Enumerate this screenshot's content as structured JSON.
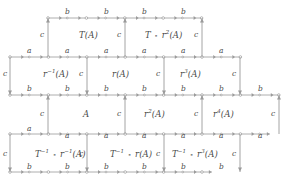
{
  "figure": {
    "name": "tiling-diagram",
    "stroke_color": "#9a9a9a",
    "text_color": "#4a4a4a",
    "background": "#ffffff"
  },
  "cells": [
    {
      "id": "cell-TA",
      "text": "T(A)",
      "x": 79,
      "y": 31
    },
    {
      "id": "cell-Tr2A",
      "text": "T ∘ r²(A)",
      "x": 145,
      "y": 31
    },
    {
      "id": "cell-rinvA",
      "text": "r⁻¹(A)",
      "x": 43,
      "y": 70
    },
    {
      "id": "cell-rA",
      "text": "r(A)",
      "x": 112,
      "y": 70
    },
    {
      "id": "cell-r3A",
      "text": "r³(A)",
      "x": 180,
      "y": 70
    },
    {
      "id": "cell-A",
      "text": "A",
      "x": 83,
      "y": 110
    },
    {
      "id": "cell-r2A",
      "text": "r²(A)",
      "x": 144,
      "y": 110
    },
    {
      "id": "cell-r4A",
      "text": "r⁴(A)",
      "x": 213,
      "y": 110
    },
    {
      "id": "cell-Tinv-rinvA",
      "text": "T⁻¹ ∘ r⁻¹(A)",
      "x": 35,
      "y": 150
    },
    {
      "id": "cell-Tinv-rA",
      "text": "T⁻¹ ∘ r(A)",
      "x": 110,
      "y": 150
    },
    {
      "id": "cell-Tinv-r3A",
      "text": "T⁻¹ ∘ r³(A)",
      "x": 172,
      "y": 150
    }
  ],
  "edge_labels": {
    "row1_b": [
      {
        "text": "b",
        "x": 65,
        "y": 8
      },
      {
        "text": "b",
        "x": 104,
        "y": 8
      },
      {
        "text": "b",
        "x": 142,
        "y": 8
      },
      {
        "text": "b",
        "x": 181,
        "y": 8
      }
    ],
    "row2_a": [
      {
        "text": "a",
        "x": 27,
        "y": 47
      },
      {
        "text": "a",
        "x": 65,
        "y": 47
      },
      {
        "text": "a",
        "x": 104,
        "y": 47
      },
      {
        "text": "a",
        "x": 142,
        "y": 47
      },
      {
        "text": "a",
        "x": 181,
        "y": 47
      },
      {
        "text": "a",
        "x": 219,
        "y": 47
      }
    ],
    "row3_b": [
      {
        "text": "b",
        "x": 27,
        "y": 85
      },
      {
        "text": "b",
        "x": 65,
        "y": 85
      },
      {
        "text": "b",
        "x": 104,
        "y": 85
      },
      {
        "text": "b",
        "x": 142,
        "y": 85
      },
      {
        "text": "b",
        "x": 181,
        "y": 85
      },
      {
        "text": "b",
        "x": 219,
        "y": 85
      },
      {
        "text": "b",
        "x": 258,
        "y": 85
      }
    ],
    "row4_a": [
      {
        "text": "a",
        "x": 27,
        "y": 125
      },
      {
        "text": "a",
        "x": 65,
        "y": 132
      },
      {
        "text": "a",
        "x": 104,
        "y": 132
      },
      {
        "text": "a",
        "x": 142,
        "y": 132
      },
      {
        "text": "a",
        "x": 181,
        "y": 132
      },
      {
        "text": "a",
        "x": 219,
        "y": 132
      },
      {
        "text": "a",
        "x": 258,
        "y": 132
      }
    ],
    "row5_b": [
      {
        "text": "b",
        "x": 27,
        "y": 163
      },
      {
        "text": "b",
        "x": 65,
        "y": 163
      },
      {
        "text": "b",
        "x": 104,
        "y": 163
      },
      {
        "text": "b",
        "x": 142,
        "y": 163
      },
      {
        "text": "b",
        "x": 181,
        "y": 163
      },
      {
        "text": "b",
        "x": 219,
        "y": 163
      }
    ],
    "vertical_c": [
      {
        "text": "c",
        "x": 40,
        "y": 31
      },
      {
        "text": "c",
        "x": 117,
        "y": 31
      },
      {
        "text": "c",
        "x": 194,
        "y": 31
      },
      {
        "text": "c",
        "x": 3,
        "y": 70
      },
      {
        "text": "c",
        "x": 79,
        "y": 70
      },
      {
        "text": "c",
        "x": 156,
        "y": 70
      },
      {
        "text": "c",
        "x": 232,
        "y": 70
      },
      {
        "text": "c",
        "x": 40,
        "y": 110
      },
      {
        "text": "c",
        "x": 117,
        "y": 110
      },
      {
        "text": "c",
        "x": 194,
        "y": 110
      },
      {
        "text": "c",
        "x": 271,
        "y": 110
      },
      {
        "text": "c",
        "x": 3,
        "y": 150
      },
      {
        "text": "c",
        "x": 79,
        "y": 150
      },
      {
        "text": "c",
        "x": 156,
        "y": 150
      },
      {
        "text": "c",
        "x": 232,
        "y": 150
      }
    ]
  },
  "graph_geometry": {
    "rows_y": [
      18,
      57,
      95,
      134,
      172
    ],
    "node_spacing": 19.2,
    "row_extents": [
      {
        "x1": 48,
        "x2": 202
      },
      {
        "x1": 10,
        "x2": 240
      },
      {
        "x1": 10,
        "x2": 279
      },
      {
        "x1": 10,
        "x2": 270
      },
      {
        "x1": 10,
        "x2": 212
      }
    ],
    "vertical_edges": [
      {
        "x": 48,
        "y1": 57,
        "y2": 18,
        "dir": "up"
      },
      {
        "x": 125,
        "y1": 57,
        "y2": 18,
        "dir": "up"
      },
      {
        "x": 202,
        "y1": 57,
        "y2": 18,
        "dir": "up"
      },
      {
        "x": 10,
        "y1": 57,
        "y2": 95,
        "dir": "down"
      },
      {
        "x": 87,
        "y1": 57,
        "y2": 95,
        "dir": "down"
      },
      {
        "x": 164,
        "y1": 57,
        "y2": 95,
        "dir": "down"
      },
      {
        "x": 240,
        "y1": 57,
        "y2": 95,
        "dir": "down"
      },
      {
        "x": 48,
        "y1": 134,
        "y2": 95,
        "dir": "up"
      },
      {
        "x": 125,
        "y1": 134,
        "y2": 95,
        "dir": "up"
      },
      {
        "x": 202,
        "y1": 134,
        "y2": 95,
        "dir": "up"
      },
      {
        "x": 279,
        "y1": 134,
        "y2": 95,
        "dir": "up"
      },
      {
        "x": 10,
        "y1": 134,
        "y2": 172,
        "dir": "down"
      },
      {
        "x": 87,
        "y1": 134,
        "y2": 172,
        "dir": "down"
      },
      {
        "x": 164,
        "y1": 134,
        "y2": 172,
        "dir": "down"
      },
      {
        "x": 240,
        "y1": 134,
        "y2": 172,
        "dir": "down"
      }
    ]
  }
}
